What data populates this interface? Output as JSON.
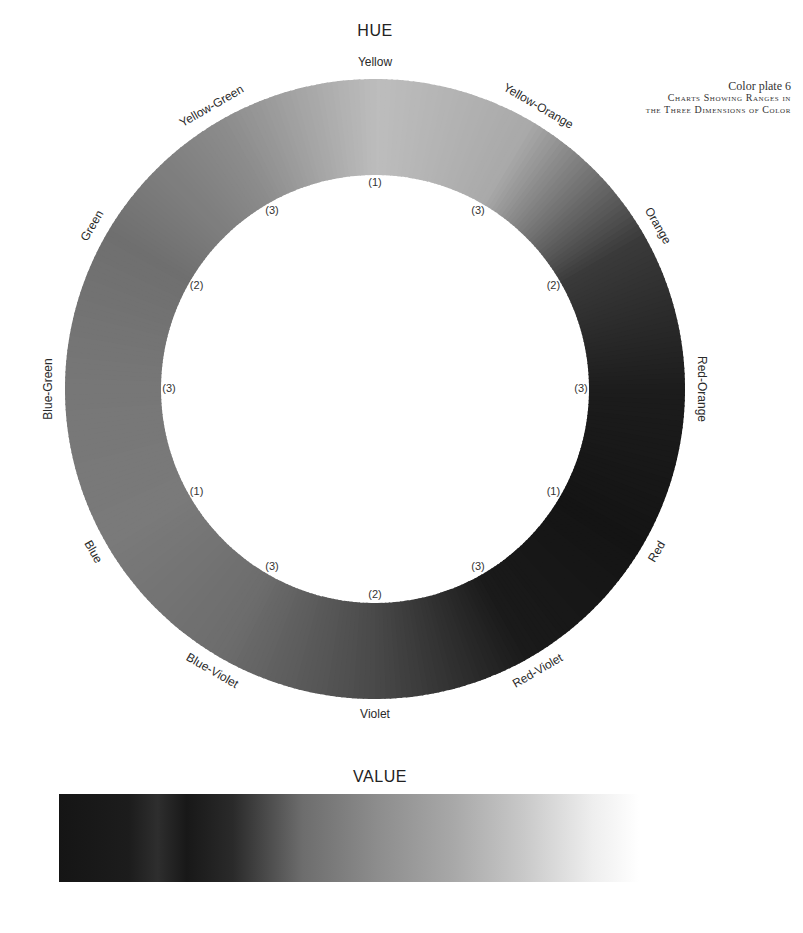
{
  "caption": {
    "line1": "Color plate 6",
    "line2": "Charts Showing Ranges in",
    "line3": "the Three Dimensions of Color"
  },
  "hue": {
    "title": "HUE",
    "center": [
      375,
      389
    ],
    "outer_radius": 310,
    "inner_radius": 214,
    "hue_labels": [
      {
        "text": "Yellow",
        "angle": 0
      },
      {
        "text": "Yellow-Orange",
        "angle": 30
      },
      {
        "text": "Orange",
        "angle": 60
      },
      {
        "text": "Red-Orange",
        "angle": 90
      },
      {
        "text": "Red",
        "angle": 120
      },
      {
        "text": "Red-Violet",
        "angle": 150
      },
      {
        "text": "Violet",
        "angle": 180
      },
      {
        "text": "Blue-Violet",
        "angle": 210
      },
      {
        "text": "Blue",
        "angle": 240
      },
      {
        "text": "Blue-Green",
        "angle": 270
      },
      {
        "text": "Green",
        "angle": 300
      },
      {
        "text": "Yellow-Green",
        "angle": 330
      }
    ],
    "inner_markers": [
      {
        "text": "(1)",
        "angle": 0
      },
      {
        "text": "(3)",
        "angle": 30
      },
      {
        "text": "(2)",
        "angle": 60
      },
      {
        "text": "(3)",
        "angle": 90
      },
      {
        "text": "(1)",
        "angle": 120
      },
      {
        "text": "(3)",
        "angle": 150
      },
      {
        "text": "(2)",
        "angle": 180
      },
      {
        "text": "(3)",
        "angle": 210
      },
      {
        "text": "(1)",
        "angle": 240
      },
      {
        "text": "(3)",
        "angle": 270
      },
      {
        "text": "(2)",
        "angle": 300
      },
      {
        "text": "(3)",
        "angle": 330
      }
    ],
    "ring_grays": [
      "#bdbdbd",
      "#a9a9a9",
      "#3a3a3a",
      "#1c1c1c",
      "#141414",
      "#1a1a1a",
      "#4a4a4a",
      "#6d6d6d",
      "#7a7a7a",
      "#777777",
      "#6f6f6f",
      "#8c8c8c"
    ]
  },
  "value": {
    "title": "VALUE"
  }
}
